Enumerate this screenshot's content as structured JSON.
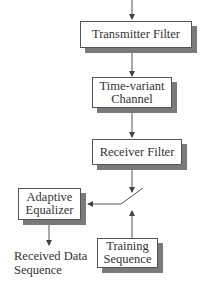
{
  "diagram": {
    "type": "block-diagram",
    "blocks": {
      "transmitter_filter": {
        "label": "Transmitter Filter"
      },
      "channel": {
        "line1": "Time-variant",
        "line2": "Channel"
      },
      "receiver_filter": {
        "label": "Receiver Filter"
      },
      "adaptive_equalizer": {
        "line1": "Adaptive",
        "line2": "Equalizer"
      },
      "training_sequence": {
        "line1": "Training",
        "line2": "Sequence"
      }
    },
    "output": {
      "line1": "Received Data",
      "line2": "Sequence"
    },
    "connections": [
      {
        "from": "input",
        "to": "transmitter_filter"
      },
      {
        "from": "transmitter_filter",
        "to": "channel"
      },
      {
        "from": "channel",
        "to": "receiver_filter"
      },
      {
        "from": "receiver_filter",
        "to": "switch"
      },
      {
        "from": "training_sequence",
        "to": "switch"
      },
      {
        "from": "switch",
        "to": "adaptive_equalizer"
      },
      {
        "from": "adaptive_equalizer",
        "to": "output"
      }
    ],
    "colors": {
      "line": "#555555",
      "shadow": "#7a7a7a",
      "text": "#333333",
      "background": "#ffffff"
    }
  }
}
